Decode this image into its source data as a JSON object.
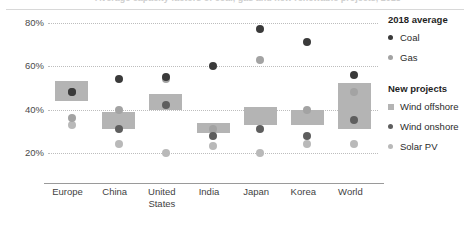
{
  "title": {
    "text": "Average capacity factors of coal, gas and new renewable projects, 2018"
  },
  "legend": {
    "groups": [
      {
        "heading": "2018 average",
        "items": [
          {
            "label": "Coal",
            "marker": "circle-icon",
            "color": "#3a3a3a"
          },
          {
            "label": "Gas",
            "marker": "circle-icon",
            "color": "#a3a3a3"
          }
        ]
      },
      {
        "heading": "New projects",
        "items": [
          {
            "label": "Wind offshore",
            "marker": "square-icon",
            "color": "#b4b4b4"
          },
          {
            "label": "Wind onshore",
            "marker": "circle-icon",
            "color": "#5e5e5e"
          },
          {
            "label": "Solar PV",
            "marker": "circle-icon",
            "color": "#b9b9b9"
          }
        ]
      }
    ]
  },
  "axis": {
    "y_ticks": [
      "80%",
      "60%",
      "40%",
      "20%"
    ],
    "y_values": [
      80,
      60,
      40,
      20
    ],
    "x_categories": [
      "Europe",
      "China",
      "United States",
      "India",
      "Japan",
      "Korea",
      "World"
    ]
  },
  "chart_data": {
    "type": "scatter",
    "title": "Average capacity factors of coal, gas and new renewable projects, 2018",
    "xlabel": "",
    "ylabel": "Capacity factor",
    "ylim": [
      14,
      84
    ],
    "grid": true,
    "legend_position": "right",
    "categories": [
      "Europe",
      "China",
      "United States",
      "India",
      "Japan",
      "Korea",
      "World"
    ],
    "series": [
      {
        "name": "Coal",
        "type": "point",
        "color": "#3a3a3a",
        "values": [
          48,
          54,
          55,
          60,
          77,
          71,
          56
        ]
      },
      {
        "name": "Gas",
        "type": "point",
        "color": "#a3a3a3",
        "values": [
          36,
          40,
          54,
          31,
          63,
          40,
          48
        ]
      },
      {
        "name": "Wind offshore",
        "type": "range-box",
        "color": "#b4b4b4",
        "low": [
          44,
          31,
          40,
          29,
          33,
          33,
          31
        ],
        "high": [
          53,
          39,
          47,
          34,
          41,
          40,
          52
        ]
      },
      {
        "name": "Wind onshore",
        "type": "point",
        "color": "#5e5e5e",
        "values": [
          48,
          31,
          42,
          28,
          31,
          28,
          35
        ]
      },
      {
        "name": "Solar PV",
        "type": "point",
        "color": "#b9b9b9",
        "values": [
          33,
          24,
          20,
          23,
          20,
          24,
          24
        ]
      }
    ]
  }
}
